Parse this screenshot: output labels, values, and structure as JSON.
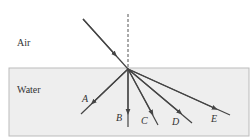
{
  "diagram": {
    "media": {
      "top": "Air",
      "bottom": "Water"
    },
    "rays": [
      {
        "label": "A"
      },
      {
        "label": "B"
      },
      {
        "label": "C"
      },
      {
        "label": "D"
      },
      {
        "label": "E"
      }
    ],
    "colors": {
      "water_fill": "#eeeeee",
      "water_border": "#bbbbbb",
      "ray": "#444444"
    }
  }
}
